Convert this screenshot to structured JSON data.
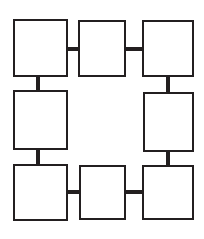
{
  "diagram": {
    "title": "",
    "type": "ring-block-diagram",
    "canvas": {
      "width": 204,
      "height": 239,
      "background_color": "#ffffff"
    },
    "style": {
      "node_fill_color": "#ffffff",
      "node_stroke_color": "#231f20",
      "node_stroke_width": 2,
      "connector_color": "#231f20",
      "connector_thickness": 4
    },
    "nodes": [
      {
        "id": "node-top-left",
        "label": "",
        "x": 13,
        "y": 19,
        "width": 55,
        "height": 58
      },
      {
        "id": "node-top-center",
        "label": "",
        "x": 78,
        "y": 20,
        "width": 48,
        "height": 57
      },
      {
        "id": "node-top-right",
        "label": "",
        "x": 142,
        "y": 20,
        "width": 52,
        "height": 57
      },
      {
        "id": "node-middle-left",
        "label": "",
        "x": 13,
        "y": 90,
        "width": 55,
        "height": 60
      },
      {
        "id": "node-middle-right",
        "label": "",
        "x": 143,
        "y": 92,
        "width": 51,
        "height": 60
      },
      {
        "id": "node-bottom-left",
        "label": "",
        "x": 13,
        "y": 164,
        "width": 55,
        "height": 57
      },
      {
        "id": "node-bottom-center",
        "label": "",
        "x": 79,
        "y": 165,
        "width": 47,
        "height": 55
      },
      {
        "id": "node-bottom-right",
        "label": "",
        "x": 142,
        "y": 165,
        "width": 52,
        "height": 55
      }
    ],
    "connectors": [
      {
        "id": "link-top-left-to-top-center",
        "orientation": "horizontal",
        "from": "node-top-left",
        "to": "node-top-center",
        "x": 66,
        "y": 47,
        "length": 14
      },
      {
        "id": "link-top-center-to-top-right",
        "orientation": "horizontal",
        "from": "node-top-center",
        "to": "node-top-right",
        "x": 124,
        "y": 47,
        "length": 20
      },
      {
        "id": "link-top-left-to-middle-left",
        "orientation": "vertical",
        "from": "node-top-left",
        "to": "node-middle-left",
        "x": 36,
        "y": 75,
        "length": 17
      },
      {
        "id": "link-top-right-to-middle-right",
        "orientation": "vertical",
        "from": "node-top-right",
        "to": "node-middle-right",
        "x": 166,
        "y": 75,
        "length": 19
      },
      {
        "id": "link-middle-left-to-bottom-left",
        "orientation": "vertical",
        "from": "node-middle-left",
        "to": "node-bottom-left",
        "x": 36,
        "y": 148,
        "length": 18
      },
      {
        "id": "link-middle-right-to-bottom-right",
        "orientation": "vertical",
        "from": "node-middle-right",
        "to": "node-bottom-right",
        "x": 166,
        "y": 150,
        "length": 17
      },
      {
        "id": "link-bottom-left-to-bottom-center",
        "orientation": "horizontal",
        "from": "node-bottom-left",
        "to": "node-bottom-center",
        "x": 66,
        "y": 190,
        "length": 15
      },
      {
        "id": "link-bottom-center-to-bottom-right",
        "orientation": "horizontal",
        "from": "node-bottom-center",
        "to": "node-bottom-right",
        "x": 124,
        "y": 190,
        "length": 20
      }
    ]
  }
}
